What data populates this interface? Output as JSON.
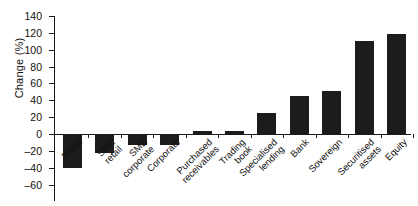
{
  "chart_data": {
    "type": "bar",
    "title": "",
    "xlabel": "",
    "ylabel": "Change (%)",
    "ylim": [
      -60,
      140
    ],
    "ytick_step": 20,
    "grid": false,
    "legend": null,
    "bar_color": "#1c1c1c",
    "axis_color": "#1a1a1a",
    "yticks": [
      140,
      120,
      100,
      80,
      60,
      40,
      20,
      0,
      -20,
      -40,
      -60
    ],
    "ytick_labels": [
      "140",
      "120",
      "100",
      "80",
      "60",
      "40",
      "20",
      "0",
      "-20",
      "-40",
      "-60"
    ],
    "categories": [
      "Retail",
      "SME retail",
      "SME corporate",
      "Corporate",
      "Purchased receivables",
      "Trading book",
      "Specialised lending",
      "Bank",
      "Sovereign",
      "Securitised assets",
      "Equity"
    ],
    "category_lines": [
      [
        "Retail"
      ],
      [
        "SME",
        "retail"
      ],
      [
        "SME",
        "corporate"
      ],
      [
        "Corporate"
      ],
      [
        "Purchased",
        "receivables"
      ],
      [
        "Trading",
        "book"
      ],
      [
        "Specialised",
        "lending"
      ],
      [
        "Bank"
      ],
      [
        "Sovereign"
      ],
      [
        "Securitised",
        "assets"
      ],
      [
        "Equity"
      ]
    ],
    "values": [
      -40,
      -22,
      -13,
      -13,
      4,
      4,
      25,
      45,
      51,
      110,
      119
    ]
  }
}
